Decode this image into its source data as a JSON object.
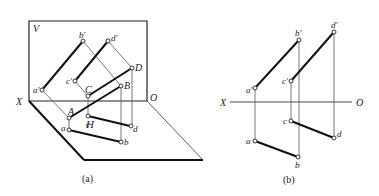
{
  "figure_a": {
    "caption": "(a)",
    "planes": {
      "V": "V",
      "H": "H"
    },
    "axis": {
      "x_label": "X",
      "o_label": "O"
    },
    "space_points": {
      "A": "A",
      "B": "B",
      "C": "C",
      "D": "D"
    },
    "front_projections": {
      "a": "a'",
      "b": "b'",
      "c": "c'",
      "d": "d'"
    },
    "top_projections": {
      "a": "a",
      "b": "b",
      "c": "c",
      "d": "d"
    }
  },
  "figure_b": {
    "caption": "(b)",
    "axis": {
      "x_label": "X",
      "o_label": "O"
    },
    "front_projections": {
      "a": "a'",
      "b": "b'",
      "c": "c'",
      "d": "d'"
    },
    "top_projections": {
      "a": "a",
      "b": "b",
      "c": "c",
      "d": "d"
    }
  }
}
